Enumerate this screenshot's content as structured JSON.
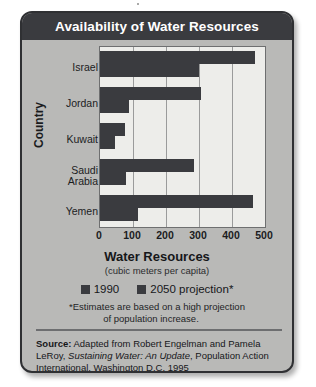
{
  "card": {
    "title": "Availability of Water Resources",
    "background_color": "#b9b9b7",
    "title_bar_color": "#3a3b3f",
    "border_color": "#2f3033"
  },
  "legend": {
    "items": [
      {
        "label": "1990",
        "color": "#3a3b3f"
      },
      {
        "label": "2050 projection*",
        "color": "#3a3b3f"
      }
    ]
  },
  "footnote": {
    "line1": "*Estimates are based on a high projection",
    "line2": "of population increase."
  },
  "source": {
    "label": "Source:",
    "text_part1": " Adapted from Robert Engelman and Pamela LeRoy, ",
    "italic_title": "Sustaining Water: An Update",
    "text_part2": ", Population Action International, Washington D.C. 1995"
  },
  "chart_data": {
    "type": "bar",
    "orientation": "horizontal",
    "title": "Availability of Water Resources",
    "xlabel": "Water Resources",
    "xlabel_sub": "(cubic meters per capita)",
    "ylabel": "Country",
    "categories": [
      "Israel",
      "Jordan",
      "Kuwait",
      "Saudi\nArabia",
      "Yemen"
    ],
    "series": [
      {
        "name": "1990",
        "color": "#3a3b3f",
        "values": [
          470,
          305,
          75,
          285,
          465
        ]
      },
      {
        "name": "2050 projection*",
        "color": "#3a3b3f",
        "values": [
          300,
          88,
          45,
          80,
          115
        ]
      }
    ],
    "xlim": [
      0,
      500
    ],
    "xticks": [
      0,
      100,
      200,
      300,
      400,
      500
    ],
    "grid": true,
    "legend_position": "bottom",
    "plot_background": "#ededea"
  }
}
